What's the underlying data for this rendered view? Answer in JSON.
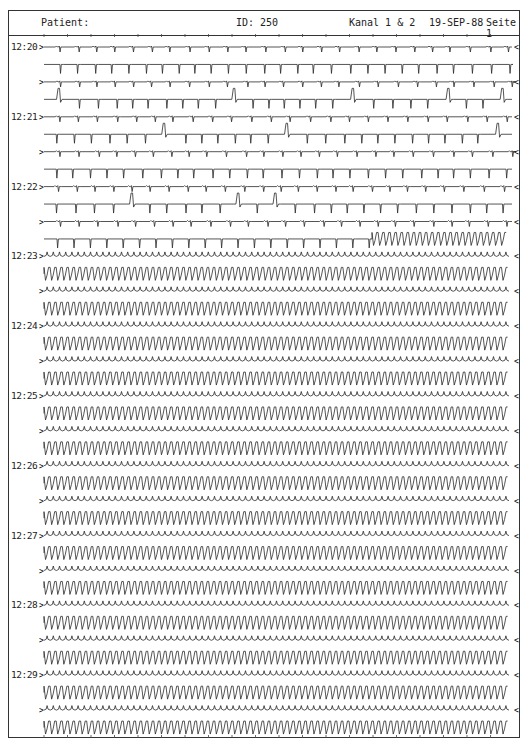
{
  "header": {
    "patient_label": "Patient:",
    "id_label": "ID:  250",
    "channel_label": "Kanal 1 & 2",
    "date": "19-SEP-88",
    "page_label": "Seite  1"
  },
  "strip": {
    "row_start_y": 47,
    "row_spacing": 17.45,
    "row_count": 40,
    "x_start": 44,
    "x_end": 512,
    "trace_color": "#2a2a2a",
    "start_marker": ">",
    "end_marker": "<"
  },
  "time_labels": [
    {
      "time": "12:20",
      "row": 0
    },
    {
      "time": "12:21",
      "row": 4
    },
    {
      "time": "12:22",
      "row": 8
    },
    {
      "time": "12:23",
      "row": 12
    },
    {
      "time": "12:24",
      "row": 16
    },
    {
      "time": "12:25",
      "row": 20
    },
    {
      "time": "12:26",
      "row": 24
    },
    {
      "time": "12:27",
      "row": 28
    },
    {
      "time": "12:28",
      "row": 32
    },
    {
      "time": "12:29",
      "row": 36
    }
  ],
  "rhythm_segments": [
    {
      "rows": "0-10",
      "rhythm": "sinus with isolated PVCs"
    },
    {
      "rows": "11",
      "rhythm": "sinus with PVCs, onset of ventricular tachycardia at end"
    },
    {
      "rows": "12-39",
      "rhythm": "sustained ventricular tachycardia"
    }
  ]
}
